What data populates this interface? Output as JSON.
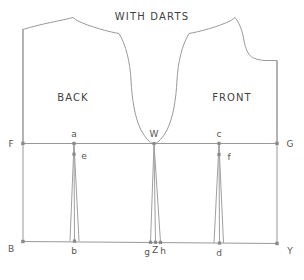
{
  "diagram": {
    "title": "WITH DARTS",
    "regions": [
      {
        "id": "back",
        "label": "BACK"
      },
      {
        "id": "front",
        "label": "FRONT"
      }
    ],
    "frame_points": [
      {
        "id": "F",
        "label": "F"
      },
      {
        "id": "G",
        "label": "G"
      },
      {
        "id": "B",
        "label": "B"
      },
      {
        "id": "Y",
        "label": "Y"
      }
    ],
    "dart_points": [
      {
        "id": "a",
        "label": "a"
      },
      {
        "id": "e",
        "label": "e"
      },
      {
        "id": "b",
        "label": "b"
      },
      {
        "id": "W",
        "label": "W"
      },
      {
        "id": "g",
        "label": "g"
      },
      {
        "id": "Z",
        "label": "Z"
      },
      {
        "id": "h",
        "label": "h"
      },
      {
        "id": "c",
        "label": "c"
      },
      {
        "id": "f",
        "label": "f"
      },
      {
        "id": "d",
        "label": "d"
      }
    ],
    "colors": {
      "line": "#999999",
      "outline": "#9a9a9a",
      "text": "#3f3f3f",
      "point_text": "#555555",
      "background": "#ffffff",
      "marker": "#8a8a8a"
    },
    "labels": {
      "title": "WITH DARTS",
      "back": "BACK",
      "front": "FRONT",
      "F": "F",
      "G": "G",
      "B": "B",
      "Y": "Y",
      "a": "a",
      "e": "e",
      "b": "b",
      "W": "W",
      "g": "g",
      "Z": "Z",
      "h": "h",
      "c": "c",
      "f": "f",
      "d": "d"
    }
  }
}
